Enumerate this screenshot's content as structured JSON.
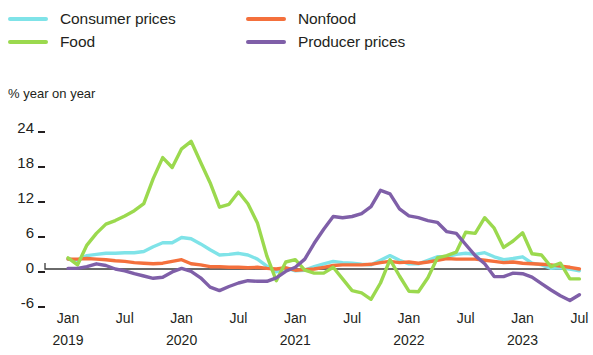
{
  "legend": {
    "items": [
      {
        "label": "Consumer prices",
        "color": "#7fe3e8",
        "col": 1,
        "row": 1,
        "icon": "line-swatch-icon"
      },
      {
        "label": "Nonfood",
        "color": "#f4703c",
        "col": 2,
        "row": 1,
        "icon": "line-swatch-icon"
      },
      {
        "label": "Food",
        "color": "#9bd94e",
        "col": 1,
        "row": 2,
        "icon": "line-swatch-icon"
      },
      {
        "label": "Producer prices",
        "color": "#7f5fa8",
        "col": 2,
        "row": 2,
        "icon": "line-swatch-icon"
      }
    ]
  },
  "chart_data": {
    "type": "line",
    "title": "",
    "subtitle": "",
    "ylabel": "% year on year",
    "xlabel": "",
    "ylim": [
      -8,
      26
    ],
    "yticks": [
      24,
      18,
      12,
      6,
      0,
      -6
    ],
    "ytick_labels": [
      "24",
      "18",
      "12",
      "6",
      "0",
      "-6"
    ],
    "grid": false,
    "zero_line": 0,
    "legend_position": "top",
    "x_start": "2019-01",
    "x_end": "2023-07",
    "xticks": [
      {
        "month": "Jan",
        "year": "2019"
      },
      {
        "month": "Jul",
        "year": ""
      },
      {
        "month": "Jan",
        "year": "2020"
      },
      {
        "month": "Jul",
        "year": ""
      },
      {
        "month": "Jan",
        "year": "2021"
      },
      {
        "month": "Jul",
        "year": ""
      },
      {
        "month": "Jan",
        "year": "2022"
      },
      {
        "month": "Jul",
        "year": ""
      },
      {
        "month": "Jan",
        "year": "2023"
      },
      {
        "month": "Jul",
        "year": ""
      }
    ],
    "x": [
      "2019-01",
      "2019-02",
      "2019-03",
      "2019-04",
      "2019-05",
      "2019-06",
      "2019-07",
      "2019-08",
      "2019-09",
      "2019-10",
      "2019-11",
      "2019-12",
      "2020-01",
      "2020-02",
      "2020-03",
      "2020-04",
      "2020-05",
      "2020-06",
      "2020-07",
      "2020-08",
      "2020-09",
      "2020-10",
      "2020-11",
      "2020-12",
      "2021-01",
      "2021-02",
      "2021-03",
      "2021-04",
      "2021-05",
      "2021-06",
      "2021-07",
      "2021-08",
      "2021-09",
      "2021-10",
      "2021-11",
      "2021-12",
      "2022-01",
      "2022-02",
      "2022-03",
      "2022-04",
      "2022-05",
      "2022-06",
      "2022-07",
      "2022-08",
      "2022-09",
      "2022-10",
      "2022-11",
      "2022-12",
      "2023-01",
      "2023-02",
      "2023-03",
      "2023-04",
      "2023-05",
      "2023-06",
      "2023-07"
    ],
    "series": [
      {
        "name": "Consumer prices",
        "color": "#7fe3e8",
        "values": [
          1.7,
          1.5,
          2.3,
          2.5,
          2.7,
          2.7,
          2.8,
          2.8,
          3.0,
          3.8,
          4.5,
          4.5,
          5.4,
          5.2,
          4.3,
          3.3,
          2.4,
          2.5,
          2.7,
          2.4,
          1.7,
          0.5,
          -0.5,
          0.2,
          -0.3,
          -0.2,
          0.4,
          0.9,
          1.3,
          1.1,
          1.0,
          0.8,
          0.7,
          1.5,
          2.3,
          1.5,
          0.9,
          0.9,
          1.5,
          2.1,
          2.1,
          2.5,
          2.7,
          2.5,
          2.8,
          2.1,
          1.6,
          1.8,
          2.1,
          1.0,
          0.7,
          0.1,
          0.2,
          0.0,
          -0.3
        ]
      },
      {
        "name": "Food",
        "color": "#9bd94e",
        "values": [
          1.9,
          0.7,
          4.1,
          6.1,
          7.7,
          8.3,
          9.1,
          10.0,
          11.2,
          15.5,
          19.1,
          17.4,
          20.6,
          21.9,
          18.3,
          14.8,
          10.6,
          11.1,
          13.2,
          11.2,
          7.9,
          2.2,
          -2.0,
          1.2,
          1.6,
          -0.2,
          -0.7,
          -0.7,
          0.3,
          -1.7,
          -3.7,
          -4.1,
          -5.2,
          -2.4,
          1.6,
          -1.2,
          -3.8,
          -3.9,
          -1.5,
          1.9,
          2.3,
          2.9,
          6.3,
          6.1,
          8.8,
          7.0,
          3.7,
          4.8,
          6.2,
          2.6,
          2.4,
          0.4,
          1.0,
          -1.7,
          -1.7
        ]
      },
      {
        "name": "Nonfood",
        "color": "#f4703c",
        "values": [
          1.7,
          1.7,
          1.8,
          1.7,
          1.6,
          1.4,
          1.3,
          1.1,
          1.0,
          0.9,
          1.0,
          1.3,
          1.6,
          0.9,
          0.7,
          0.4,
          0.4,
          0.3,
          0.3,
          0.2,
          0.3,
          0.1,
          0.0,
          0.2,
          -0.2,
          -0.1,
          0.0,
          0.3,
          0.6,
          0.7,
          0.7,
          0.7,
          0.8,
          1.1,
          1.3,
          1.1,
          1.2,
          1.0,
          1.2,
          1.5,
          1.8,
          1.7,
          1.7,
          1.7,
          1.5,
          1.3,
          1.1,
          1.2,
          1.0,
          0.9,
          0.8,
          0.7,
          0.5,
          0.3,
          0.0
        ]
      },
      {
        "name": "Producer prices",
        "color": "#7f5fa8",
        "values": [
          0.1,
          0.1,
          0.4,
          0.9,
          0.6,
          0.0,
          -0.3,
          -0.8,
          -1.2,
          -1.6,
          -1.4,
          -0.5,
          0.1,
          -0.4,
          -1.5,
          -3.1,
          -3.7,
          -3.0,
          -2.4,
          -2.0,
          -2.1,
          -2.1,
          -1.5,
          -0.4,
          0.3,
          1.7,
          4.4,
          6.8,
          9.0,
          8.8,
          9.0,
          9.5,
          10.7,
          13.5,
          12.9,
          10.3,
          9.1,
          8.8,
          8.3,
          8.0,
          6.4,
          6.1,
          4.2,
          2.3,
          0.9,
          -1.3,
          -1.3,
          -0.7,
          -0.8,
          -1.4,
          -2.5,
          -3.6,
          -4.6,
          -5.4,
          -4.4
        ]
      }
    ]
  }
}
